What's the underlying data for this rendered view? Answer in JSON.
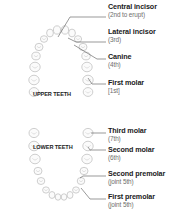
{
  "diagram": {
    "jaw_labels": {
      "upper": "UPPER TEETH",
      "lower": "LOWER TEETH"
    },
    "callouts": [
      {
        "id": "central-incisor",
        "name": "Central incisor",
        "order": "(2nd to erupt)",
        "jaw": "upper"
      },
      {
        "id": "lateral-incisor",
        "name": "Lateral incisor",
        "order": "(3rd)",
        "jaw": "upper"
      },
      {
        "id": "canine",
        "name": "Canine",
        "order": "(4th)",
        "jaw": "upper"
      },
      {
        "id": "first-molar",
        "name": "First molar",
        "order": "[1st]",
        "jaw": "upper"
      },
      {
        "id": "third-molar",
        "name": "Third molar",
        "order": "(7th)",
        "jaw": "lower"
      },
      {
        "id": "second-molar",
        "name": "Second molar",
        "order": "(6th)",
        "jaw": "lower"
      },
      {
        "id": "second-premolar",
        "name": "Second premolar",
        "order": "(joint 5th)",
        "jaw": "lower"
      },
      {
        "id": "first-premolar",
        "name": "First premolar",
        "order": "(joint 5th)",
        "jaw": "lower"
      }
    ],
    "colors": {
      "tooth_outline": "#c8c8c8",
      "leader_line": "#555555",
      "label_text": "#1a1a1a",
      "sub_text": "#6e6e6e"
    }
  }
}
